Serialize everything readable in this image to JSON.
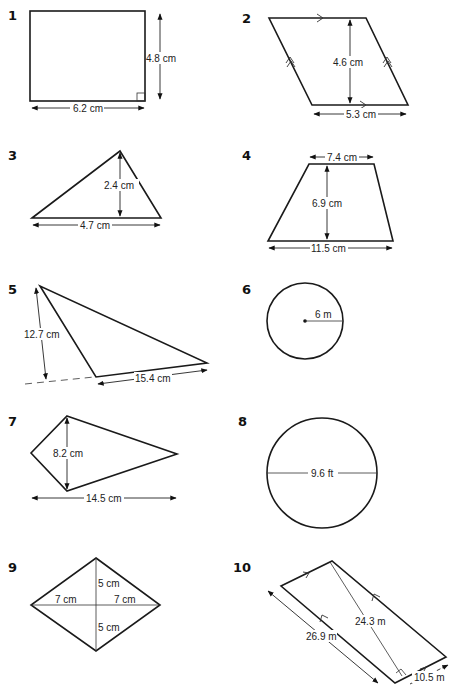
{
  "problems": [
    {
      "number": "1",
      "shape": "rectangle",
      "labels": {
        "height": "4.8 cm",
        "width": "6.2 cm"
      }
    },
    {
      "number": "2",
      "shape": "parallelogram",
      "labels": {
        "height": "4.6 cm",
        "base": "5.3 cm"
      }
    },
    {
      "number": "3",
      "shape": "triangle",
      "labels": {
        "height": "2.4 cm",
        "base": "4.7 cm"
      }
    },
    {
      "number": "4",
      "shape": "trapezium",
      "labels": {
        "top": "7.4 cm",
        "height": "6.9 cm",
        "bottom": "11.5 cm"
      }
    },
    {
      "number": "5",
      "shape": "obtuse-triangle",
      "labels": {
        "height": "12.7 cm",
        "base": "15.4 cm"
      }
    },
    {
      "number": "6",
      "shape": "circle",
      "labels": {
        "radius": "6 m"
      }
    },
    {
      "number": "7",
      "shape": "kite",
      "labels": {
        "short_diagonal": "8.2 cm",
        "long_diagonal": "14.5 cm"
      }
    },
    {
      "number": "8",
      "shape": "circle",
      "labels": {
        "diameter": "9.6 ft"
      }
    },
    {
      "number": "9",
      "shape": "rhombus",
      "labels": {
        "half_horizontal_left": "7 cm",
        "half_horizontal_right": "7 cm",
        "half_vertical_top": "5 cm",
        "half_vertical_bottom": "5 cm"
      }
    },
    {
      "number": "10",
      "shape": "parallelogram",
      "labels": {
        "height": "24.3 m",
        "side": "26.9 m",
        "base": "10.5 m"
      }
    }
  ]
}
